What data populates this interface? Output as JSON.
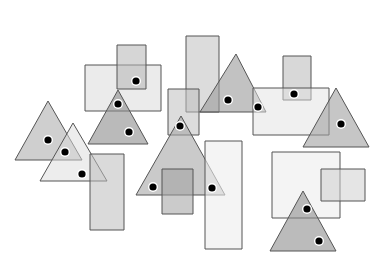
{
  "canvas": {
    "width": 376,
    "height": 254,
    "background": "#ffffff"
  },
  "style": {
    "stroke": "#555555",
    "dot_fill": "#000000",
    "dot_ring": "#ffffff"
  },
  "shapes": [
    {
      "id": "rect-a",
      "type": "rect",
      "x": 85,
      "y": 65,
      "w": 76,
      "h": 46,
      "fill": "#d8d8d8",
      "opacity": 0.5
    },
    {
      "id": "rect-b",
      "type": "rect",
      "x": 117,
      "y": 45,
      "w": 29,
      "h": 44,
      "fill": "#b4b4b4",
      "opacity": 0.55
    },
    {
      "id": "rect-c",
      "type": "rect",
      "x": 186,
      "y": 36,
      "w": 33,
      "h": 76,
      "fill": "#c4c4c4",
      "opacity": 0.6
    },
    {
      "id": "tri-d",
      "type": "tri",
      "points": [
        [
          236,
          54
        ],
        [
          200,
          112
        ],
        [
          266,
          112
        ]
      ],
      "fill": "#9a9a9a",
      "opacity": 0.6
    },
    {
      "id": "rect-e",
      "type": "rect",
      "x": 283,
      "y": 56,
      "w": 28,
      "h": 44,
      "fill": "#b8b8b8",
      "opacity": 0.55
    },
    {
      "id": "rect-f",
      "type": "rect",
      "x": 253,
      "y": 88,
      "w": 76,
      "h": 47,
      "fill": "#e2e2e2",
      "opacity": 0.5
    },
    {
      "id": "tri-g",
      "type": "tri",
      "points": [
        [
          336,
          88
        ],
        [
          303,
          147
        ],
        [
          369,
          147
        ]
      ],
      "fill": "#a0a0a0",
      "opacity": 0.6
    },
    {
      "id": "tri-h",
      "type": "tri",
      "points": [
        [
          48,
          101
        ],
        [
          15,
          160
        ],
        [
          82,
          160
        ]
      ],
      "fill": "#a8a8a8",
      "opacity": 0.55
    },
    {
      "id": "tri-i",
      "type": "tri",
      "points": [
        [
          73,
          123
        ],
        [
          40,
          181
        ],
        [
          107,
          181
        ]
      ],
      "fill": "#dcdcdc",
      "opacity": 0.5
    },
    {
      "id": "rect-j",
      "type": "rect",
      "x": 90,
      "y": 154,
      "w": 34,
      "h": 76,
      "fill": "#bcbcbc",
      "opacity": 0.55
    },
    {
      "id": "tri-k",
      "type": "tri",
      "points": [
        [
          118,
          90
        ],
        [
          88,
          144
        ],
        [
          148,
          144
        ]
      ],
      "fill": "#8c8c8c",
      "opacity": 0.6
    },
    {
      "id": "rect-l",
      "type": "rect",
      "x": 168,
      "y": 89,
      "w": 31,
      "h": 46,
      "fill": "#c0c0c0",
      "opacity": 0.55
    },
    {
      "id": "tri-m",
      "type": "tri",
      "points": [
        [
          181,
          116
        ],
        [
          136,
          195
        ],
        [
          225,
          195
        ]
      ],
      "fill": "#a6a6a6",
      "opacity": 0.6
    },
    {
      "id": "rect-n",
      "type": "rect",
      "x": 162,
      "y": 169,
      "w": 31,
      "h": 45,
      "fill": "#a0a0a0",
      "opacity": 0.55
    },
    {
      "id": "rect-o",
      "type": "rect",
      "x": 205,
      "y": 141,
      "w": 37,
      "h": 108,
      "fill": "#ececec",
      "opacity": 0.6
    },
    {
      "id": "rect-p",
      "type": "rect",
      "x": 272,
      "y": 152,
      "w": 68,
      "h": 66,
      "fill": "#eaeaea",
      "opacity": 0.5
    },
    {
      "id": "rect-q",
      "type": "rect",
      "x": 321,
      "y": 169,
      "w": 44,
      "h": 32,
      "fill": "#d0d0d0",
      "opacity": 0.55
    },
    {
      "id": "tri-r",
      "type": "tri",
      "points": [
        [
          303,
          191
        ],
        [
          270,
          251
        ],
        [
          336,
          251
        ]
      ],
      "fill": "#8e8e8e",
      "opacity": 0.6
    }
  ],
  "dots": [
    {
      "x": 136,
      "y": 81
    },
    {
      "x": 118,
      "y": 104
    },
    {
      "x": 129,
      "y": 132
    },
    {
      "x": 228,
      "y": 100
    },
    {
      "x": 258,
      "y": 107
    },
    {
      "x": 294,
      "y": 94
    },
    {
      "x": 341,
      "y": 124
    },
    {
      "x": 48,
      "y": 140
    },
    {
      "x": 65,
      "y": 152
    },
    {
      "x": 82,
      "y": 174
    },
    {
      "x": 180,
      "y": 126
    },
    {
      "x": 153,
      "y": 187
    },
    {
      "x": 212,
      "y": 188
    },
    {
      "x": 307,
      "y": 209
    },
    {
      "x": 319,
      "y": 241
    }
  ]
}
